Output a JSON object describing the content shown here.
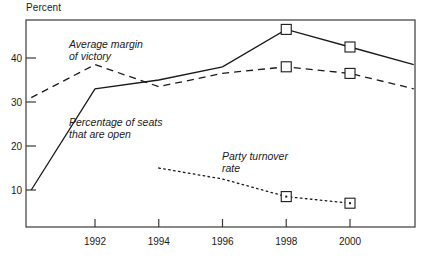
{
  "chart_data": {
    "type": "line",
    "title": "",
    "subtitle": "",
    "xlabel": "",
    "ylabel": "Percent",
    "ylim": [
      0,
      50
    ],
    "xlim": [
      1990,
      2002
    ],
    "grid": false,
    "legend_position": "inline-annotations",
    "x_tick_labels": [
      "1992",
      "1994",
      "1996",
      "1998",
      "2000"
    ],
    "x_ticks": [
      1992,
      1994,
      1996,
      1998,
      2000
    ],
    "y_tick_labels": [
      "10",
      "20",
      "30",
      "40"
    ],
    "y_ticks": [
      10,
      20,
      30,
      40
    ],
    "series": [
      {
        "name": "Percentage of seats that are open",
        "style": "solid",
        "x": [
          1990,
          1992,
          1994,
          1996,
          1998,
          2000,
          2002
        ],
        "values": [
          10,
          33,
          35,
          38,
          46.5,
          42.5,
          38.5
        ],
        "markers_at": [
          1998,
          2000
        ]
      },
      {
        "name": "Average margin of victory",
        "style": "dashed",
        "x": [
          1990,
          1992,
          1994,
          1996,
          1998,
          2000,
          2002
        ],
        "values": [
          31,
          38.5,
          33.5,
          36.5,
          38,
          36.5,
          33
        ],
        "markers_at": [
          1998,
          2000
        ]
      },
      {
        "name": "Party turnover rate",
        "style": "dotted",
        "x": [
          1994,
          1996,
          1998,
          2000
        ],
        "values": [
          15,
          12.5,
          8.5,
          7
        ],
        "markers_at": [
          1998,
          2000
        ]
      }
    ],
    "annotations": [
      {
        "name": "average-margin-of-victory",
        "lines": [
          "Average margin",
          "of victory"
        ],
        "x": 69,
        "y": 48
      },
      {
        "name": "percentage-of-seats-that-are-open",
        "lines": [
          "Percentage of seats",
          "that are open"
        ],
        "x": 69,
        "y": 126
      },
      {
        "name": "party-turnover-rate",
        "lines": [
          "Party turnover",
          "rate"
        ],
        "x": 222,
        "y": 160
      }
    ]
  },
  "colors": {
    "ink": "#1a1a1a",
    "frame": "#3a3a3a",
    "background": "#ffffff",
    "marker_fill": "#ffffff"
  }
}
